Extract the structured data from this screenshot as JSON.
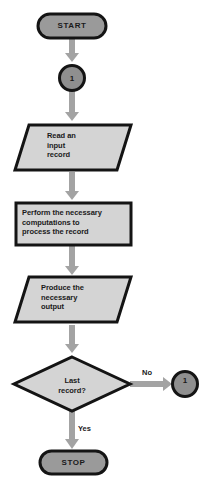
{
  "diagram": {
    "colors": {
      "background": "#ffffff",
      "terminator_fill": "#9a9a9a",
      "shape_fill": "#d4d4d4",
      "connector_fill": "#8f8f8f",
      "outline": "#141414",
      "arrow": "#a3a3a3",
      "text": "#1a1a1a"
    },
    "nodes": [
      {
        "id": "start",
        "type": "terminator",
        "label": "START"
      },
      {
        "id": "connector-top",
        "type": "connector",
        "label": "1"
      },
      {
        "id": "read",
        "type": "input-output",
        "label": "Read an\ninput\nrecord"
      },
      {
        "id": "process",
        "type": "process",
        "label": "Perform the necessary\ncomputations to\nprocess the record"
      },
      {
        "id": "output",
        "type": "input-output",
        "label": "Produce the\nnecessary\noutput"
      },
      {
        "id": "decision",
        "type": "decision",
        "label": "Last\nrecord?"
      },
      {
        "id": "connector-right",
        "type": "connector",
        "label": "1"
      },
      {
        "id": "stop",
        "type": "terminator",
        "label": "STOP"
      }
    ],
    "edges": [
      {
        "from": "start",
        "to": "connector-top",
        "label": ""
      },
      {
        "from": "connector-top",
        "to": "read",
        "label": ""
      },
      {
        "from": "read",
        "to": "process",
        "label": ""
      },
      {
        "from": "process",
        "to": "output",
        "label": ""
      },
      {
        "from": "output",
        "to": "decision",
        "label": ""
      },
      {
        "from": "decision",
        "to": "connector-right",
        "label": "No"
      },
      {
        "from": "decision",
        "to": "stop",
        "label": "Yes"
      }
    ]
  }
}
